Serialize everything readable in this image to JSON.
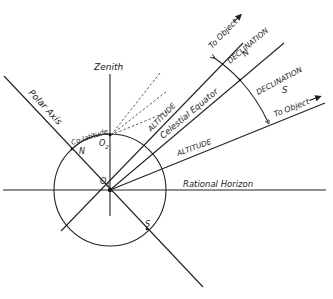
{
  "diagram": {
    "colors": {
      "ink": "#222222",
      "background": "#ffffff"
    },
    "labels": {
      "zenith": "Zenith",
      "polar_axis": "Polar Axis",
      "co_latitude": "Co-latitude",
      "north": "N",
      "south": "S",
      "o2": "O",
      "o2_sub": "2",
      "o1": "O",
      "o1_sub": "1",
      "altitude_upper": "ALTITUDE",
      "celestial_equator": "Celestial Equator",
      "altitude_lower": "ALTITUDE",
      "rational_horizon": "Rational Horizon",
      "to_object_upper": "To Object",
      "to_object_lower": "To Object",
      "declination_n_title": "DECLINATION",
      "declination_n_letter": "N",
      "declination_s_title": "DECLINATION",
      "declination_s_letter": "S"
    },
    "geometry": {
      "center_o1": [
        110,
        190
      ],
      "center_o2": [
        110,
        135
      ],
      "circle_radius": 56,
      "declination_arc_radius": 172
    }
  }
}
